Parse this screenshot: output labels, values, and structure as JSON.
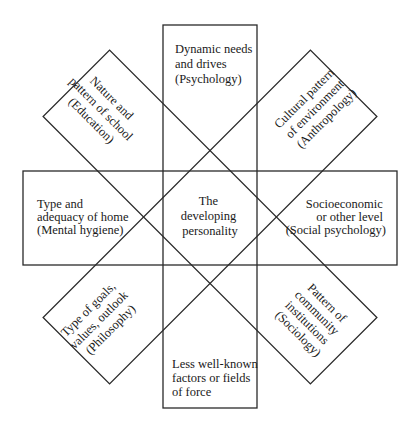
{
  "diagram": {
    "center": {
      "lines": [
        "The",
        "developing",
        "personality"
      ]
    },
    "factors": [
      {
        "id": "top",
        "position": "north",
        "lines": [
          "Dynamic needs",
          "and drives",
          "(Psychology)"
        ]
      },
      {
        "id": "top-right",
        "position": "north-east",
        "lines": [
          "Cultural pattern",
          "of environment",
          "(Anthropology)"
        ]
      },
      {
        "id": "right",
        "position": "east",
        "lines": [
          "Socioeconomic",
          "or other level",
          "(Social psychology)"
        ]
      },
      {
        "id": "bottom-right",
        "position": "south-east",
        "lines": [
          "Pattern of",
          "community",
          "institutions",
          "(Sociology)"
        ]
      },
      {
        "id": "bottom",
        "position": "south",
        "lines": [
          "Less well-known",
          "factors or fields",
          "of force"
        ]
      },
      {
        "id": "bottom-left",
        "position": "south-west",
        "lines": [
          "Type of goals,",
          "values, outlook",
          "(Philosophy)"
        ]
      },
      {
        "id": "left",
        "position": "west",
        "lines": [
          "Type and",
          "adequacy of home",
          "(Mental hygiene)"
        ]
      },
      {
        "id": "top-left",
        "position": "north-west",
        "lines": [
          "Nature and",
          "pattern of school",
          "(Education)"
        ]
      }
    ],
    "colors": {
      "stroke": "#2a2a2a",
      "text": "#1a1a1a",
      "background": "#ffffff"
    }
  }
}
